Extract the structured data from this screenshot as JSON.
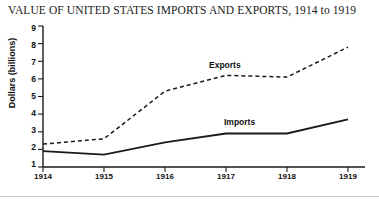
{
  "chart_data": {
    "type": "line",
    "title": "VALUE OF UNITED STATES IMPORTS AND EXPORTS, 1914 to 1919",
    "xlabel": "",
    "ylabel": "Dollars (billions)",
    "categories": [
      "1914",
      "1915",
      "1916",
      "1917",
      "1918",
      "1919"
    ],
    "x": [
      1914,
      1915,
      1916,
      1917,
      1918,
      1919
    ],
    "xlim": [
      1914,
      1919
    ],
    "ylim": [
      1,
      9
    ],
    "yticks": [
      1,
      2,
      3,
      4,
      5,
      6,
      7,
      8,
      9
    ],
    "ytick_labels": [
      "1",
      "2",
      "3",
      "4",
      "5",
      "6",
      "7",
      "8",
      "9"
    ],
    "xticks": [
      1914,
      1915,
      1916,
      1917,
      1918,
      1919
    ],
    "xtick_labels": [
      "1914",
      "1915",
      "1916",
      "1917",
      "1918",
      "1919"
    ],
    "grid": false,
    "legend_position": "inline-annotation",
    "series": [
      {
        "name": "Exports",
        "style": "dashed",
        "color": "#1a1a1a",
        "values": [
          2.3,
          2.6,
          5.3,
          6.2,
          6.1,
          7.8
        ]
      },
      {
        "name": "Imports",
        "style": "solid",
        "color": "#1a1a1a",
        "values": [
          1.9,
          1.7,
          2.4,
          2.9,
          2.9,
          3.7
        ]
      }
    ],
    "annotations": [
      {
        "text": "Exports",
        "series": "Exports"
      },
      {
        "text": "Imports",
        "series": "Imports"
      }
    ]
  }
}
